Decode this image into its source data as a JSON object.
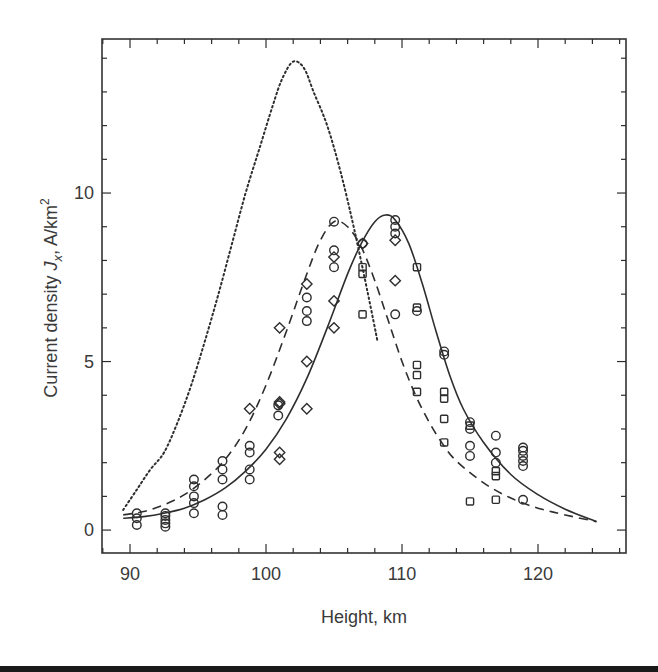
{
  "chart_data": {
    "type": "line",
    "title": "",
    "xlabel": "Height, km",
    "ylabel_parts": {
      "prefix": "Current density ",
      "symbol": "J",
      "subscript": "x",
      "unit": ", A/km",
      "superscript": "2"
    },
    "ylabel": "Current density Jx, A/km²",
    "xlim": [
      87.94,
      126.47
    ],
    "ylim": [
      -0.68,
      14.57
    ],
    "x_ticks_major": [
      90,
      100,
      110,
      120
    ],
    "x_tick_labels": [
      "90",
      "100",
      "110",
      "120"
    ],
    "x_ticks_minor_step": 2,
    "y_ticks_major": [
      0,
      5,
      10
    ],
    "y_tick_labels": [
      "0",
      "5",
      "10"
    ],
    "y_ticks_minor_step": 1,
    "grid": false,
    "legend": null,
    "series": [
      {
        "name": "dotted-model",
        "style": "dotted",
        "x": [
          89.5,
          90.5,
          91.5,
          92.5,
          93.5,
          94.5,
          95.5,
          96.5,
          97.5,
          98.5,
          99.5,
          100.5,
          101.2,
          102.0,
          102.8,
          103.5,
          104.5,
          105.5,
          106.5,
          107.5,
          108.2
        ],
        "y": [
          0.6,
          1.2,
          1.8,
          2.3,
          3.2,
          4.3,
          5.6,
          7.0,
          8.5,
          10.0,
          11.3,
          12.6,
          13.4,
          13.9,
          13.7,
          13.0,
          12.0,
          10.6,
          8.9,
          7.0,
          5.6
        ]
      },
      {
        "name": "dashed-model",
        "style": "dashed",
        "x": [
          89.5,
          91,
          92.5,
          94,
          95.5,
          97,
          98.5,
          100,
          101.5,
          103,
          104,
          105,
          106,
          107,
          108,
          109,
          110,
          111,
          112,
          113,
          114,
          116,
          118,
          120,
          122,
          124.3
        ],
        "y": [
          0.45,
          0.55,
          0.75,
          1.05,
          1.5,
          2.1,
          3.0,
          4.3,
          5.9,
          7.6,
          8.6,
          9.15,
          9.0,
          8.4,
          7.4,
          6.2,
          5.0,
          4.0,
          3.2,
          2.55,
          2.05,
          1.4,
          0.95,
          0.65,
          0.45,
          0.25
        ]
      },
      {
        "name": "solid-model",
        "style": "solid",
        "x": [
          89.5,
          91,
          92.5,
          94,
          95.5,
          97,
          98.5,
          100,
          101.5,
          103,
          104.5,
          106,
          107,
          108,
          108.8,
          109.5,
          110.5,
          111.5,
          112.5,
          113.5,
          114.5,
          116,
          118,
          120,
          122,
          124.3
        ],
        "y": [
          0.35,
          0.4,
          0.5,
          0.65,
          0.9,
          1.25,
          1.75,
          2.4,
          3.3,
          4.5,
          6.0,
          7.6,
          8.5,
          9.15,
          9.35,
          9.2,
          8.5,
          7.3,
          5.9,
          4.6,
          3.6,
          2.6,
          1.65,
          1.05,
          0.62,
          0.25
        ]
      }
    ],
    "markers": {
      "circles": [
        [
          90.5,
          0.15
        ],
        [
          90.5,
          0.35
        ],
        [
          90.5,
          0.5
        ],
        [
          92.6,
          0.1
        ],
        [
          92.6,
          0.2
        ],
        [
          92.6,
          0.3
        ],
        [
          92.6,
          0.42
        ],
        [
          92.6,
          0.5
        ],
        [
          94.7,
          0.5
        ],
        [
          94.7,
          0.8
        ],
        [
          94.7,
          1.0
        ],
        [
          94.7,
          1.3
        ],
        [
          94.7,
          1.5
        ],
        [
          96.8,
          0.45
        ],
        [
          96.8,
          0.7
        ],
        [
          96.8,
          1.5
        ],
        [
          96.8,
          1.8
        ],
        [
          96.8,
          2.05
        ],
        [
          98.8,
          1.5
        ],
        [
          98.8,
          1.8
        ],
        [
          98.8,
          2.3
        ],
        [
          98.8,
          2.5
        ],
        [
          100.9,
          3.4
        ],
        [
          100.9,
          3.7
        ],
        [
          103.0,
          6.2
        ],
        [
          103.0,
          6.5
        ],
        [
          103.0,
          6.9
        ],
        [
          105.0,
          7.8
        ],
        [
          105.0,
          8.3
        ],
        [
          105.0,
          9.15
        ],
        [
          107.1,
          8.5
        ],
        [
          109.5,
          6.4
        ],
        [
          109.5,
          8.8
        ],
        [
          109.5,
          9.0
        ],
        [
          109.5,
          9.2
        ],
        [
          111.1,
          6.5
        ],
        [
          113.1,
          5.2
        ],
        [
          113.1,
          5.3
        ],
        [
          115.0,
          3.0
        ],
        [
          115.0,
          3.2
        ],
        [
          115.0,
          2.2
        ],
        [
          115.0,
          2.5
        ],
        [
          116.9,
          2.8
        ],
        [
          116.9,
          2.0
        ],
        [
          116.9,
          2.3
        ],
        [
          118.9,
          1.9
        ],
        [
          118.9,
          2.05
        ],
        [
          118.9,
          2.2
        ],
        [
          118.9,
          2.35
        ],
        [
          118.9,
          2.45
        ],
        [
          118.9,
          0.9
        ]
      ],
      "diamonds": [
        [
          98.8,
          3.6
        ],
        [
          101.0,
          6.0
        ],
        [
          101.0,
          3.75
        ],
        [
          101.0,
          3.8
        ],
        [
          101.0,
          2.3
        ],
        [
          101.0,
          2.1
        ],
        [
          103.0,
          7.3
        ],
        [
          103.0,
          5.0
        ],
        [
          103.0,
          3.6
        ],
        [
          105.0,
          8.1
        ],
        [
          105.0,
          6.8
        ],
        [
          105.0,
          6.0
        ],
        [
          107.1,
          8.5
        ],
        [
          109.5,
          8.6
        ],
        [
          109.5,
          7.4
        ]
      ],
      "squares": [
        [
          107.1,
          6.4
        ],
        [
          107.1,
          7.6
        ],
        [
          107.1,
          7.8
        ],
        [
          111.1,
          7.8
        ],
        [
          111.1,
          6.6
        ],
        [
          111.1,
          4.9
        ],
        [
          111.1,
          4.6
        ],
        [
          111.1,
          4.1
        ],
        [
          113.1,
          4.1
        ],
        [
          113.1,
          3.3
        ],
        [
          113.1,
          2.6
        ],
        [
          113.1,
          3.9
        ],
        [
          115.0,
          3.1
        ],
        [
          115.0,
          0.85
        ],
        [
          116.9,
          0.9
        ],
        [
          116.9,
          1.6
        ],
        [
          116.9,
          1.75
        ]
      ]
    }
  },
  "colors": {
    "ink": "#2e2e2e",
    "axis": "#333333",
    "background": "#ffffff"
  }
}
